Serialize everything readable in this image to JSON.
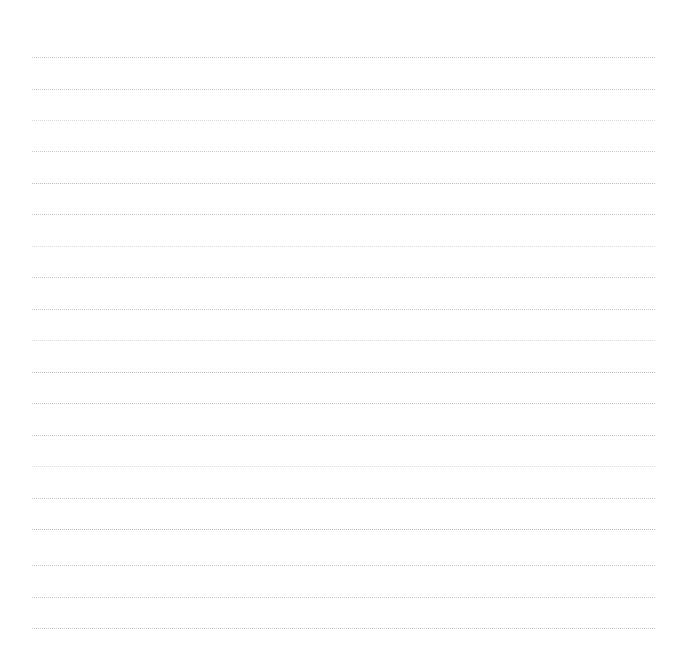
{
  "page": {
    "kind": "ruled-writing-page",
    "title": "",
    "background_color": "#ffffff",
    "width": 681,
    "height": 671
  },
  "ruling": {
    "rule_color": "#c6c6cc",
    "rule_style": "dotted",
    "rule_thickness_px": 1,
    "line_count": 19,
    "line_spacing_px": 31.7,
    "first_line_y_px": 57,
    "last_line_y_px": 628,
    "line_left_x_px": 32,
    "line_right_x_px": 655,
    "line_width_px": 623,
    "margin_top_px": 57,
    "margin_left_px": 32,
    "margin_right_px": 26,
    "margin_bottom_px": 43
  },
  "lines": [
    {
      "index": 1,
      "y": 57,
      "weight": "mid",
      "text": ""
    },
    {
      "index": 2,
      "y": 89,
      "weight": "mid",
      "text": ""
    },
    {
      "index": 3,
      "y": 120,
      "weight": "faint",
      "text": ""
    },
    {
      "index": 4,
      "y": 151,
      "weight": "mid",
      "text": ""
    },
    {
      "index": 5,
      "y": 183,
      "weight": "strong",
      "text": ""
    },
    {
      "index": 6,
      "y": 214,
      "weight": "mid",
      "text": ""
    },
    {
      "index": 7,
      "y": 246,
      "weight": "faint",
      "text": ""
    },
    {
      "index": 8,
      "y": 277,
      "weight": "mid",
      "text": ""
    },
    {
      "index": 9,
      "y": 309,
      "weight": "mid",
      "text": ""
    },
    {
      "index": 10,
      "y": 340,
      "weight": "faint",
      "text": ""
    },
    {
      "index": 11,
      "y": 372,
      "weight": "strong",
      "text": ""
    },
    {
      "index": 12,
      "y": 403,
      "weight": "mid",
      "text": ""
    },
    {
      "index": 13,
      "y": 435,
      "weight": "mid",
      "text": ""
    },
    {
      "index": 14,
      "y": 466,
      "weight": "faint",
      "text": ""
    },
    {
      "index": 15,
      "y": 498,
      "weight": "mid",
      "text": ""
    },
    {
      "index": 16,
      "y": 529,
      "weight": "strong",
      "text": ""
    },
    {
      "index": 17,
      "y": 565,
      "weight": "mid",
      "text": ""
    },
    {
      "index": 18,
      "y": 597,
      "weight": "mid",
      "text": ""
    },
    {
      "index": 19,
      "y": 628,
      "weight": "mid",
      "text": ""
    }
  ]
}
